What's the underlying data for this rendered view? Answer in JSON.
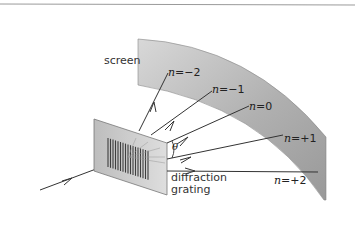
{
  "diagram": {
    "labels": {
      "screen": "screen",
      "grating_line1": "diffraction",
      "grating_line2": "grating",
      "theta": "θ"
    },
    "orders": [
      {
        "n": "n",
        "eq": "=",
        "value": "−2"
      },
      {
        "n": "n",
        "eq": "=",
        "value": "−1"
      },
      {
        "n": "n",
        "eq": "=",
        "value": "0"
      },
      {
        "n": "n",
        "eq": "=",
        "value": "+1"
      },
      {
        "n": "n",
        "eq": "=",
        "value": "+2"
      }
    ],
    "colors": {
      "screen_fill": "#a8a8a8",
      "screen_fill_light": "#d4d4d4",
      "grating_fill": "#c9c9c9",
      "slits": "#4a4a4a",
      "rays": "#333333",
      "border": "#9a9a9a"
    }
  }
}
